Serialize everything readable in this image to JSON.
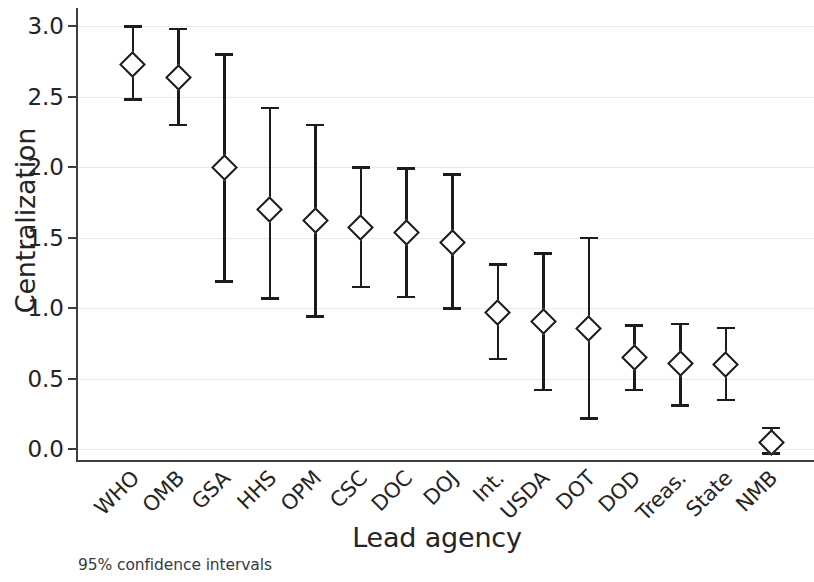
{
  "chart_data": {
    "type": "scatter",
    "title": "",
    "subtitle": "",
    "xlabel": "Lead agency",
    "ylabel": "Centralization",
    "annotation": "95% confidence intervals",
    "categories": [
      "WHO",
      "OMB",
      "GSA",
      "HHS",
      "OPM",
      "CSC",
      "DOC",
      "DOJ",
      "Int.",
      "USDA",
      "DOT",
      "DOD",
      "Treas.",
      "State",
      "NMB"
    ],
    "values": [
      2.73,
      2.64,
      2.0,
      1.7,
      1.62,
      1.57,
      1.54,
      1.47,
      0.97,
      0.91,
      0.86,
      0.65,
      0.61,
      0.6,
      0.05
    ],
    "ci_lower": [
      2.48,
      2.3,
      1.19,
      1.07,
      0.94,
      1.15,
      1.08,
      1.0,
      0.64,
      0.42,
      0.22,
      0.42,
      0.31,
      0.35,
      -0.03
    ],
    "ci_upper": [
      3.0,
      2.98,
      2.8,
      2.42,
      2.3,
      2.0,
      1.99,
      1.95,
      1.31,
      1.39,
      1.5,
      0.88,
      0.89,
      0.86,
      0.15
    ],
    "ylim": [
      -0.09,
      3.13
    ],
    "yticks": [
      0.0,
      0.5,
      1.0,
      1.5,
      2.0,
      2.5,
      3.0
    ],
    "ytick_labels": [
      "0.0",
      "0.5",
      "1.0",
      "1.5",
      "2.0",
      "2.5",
      "3.0"
    ],
    "grid": true,
    "legend": "none",
    "marker": "diamond-open",
    "error_bar_style": "capped",
    "colors": {
      "marker_edge": "#1c1c1c",
      "marker_face": "#ffffff",
      "error_bar": "#1c1c1c",
      "grid": "#e9e9e9",
      "axis": "#3d3d3d",
      "text": "#242424",
      "background": "#ffffff"
    }
  }
}
